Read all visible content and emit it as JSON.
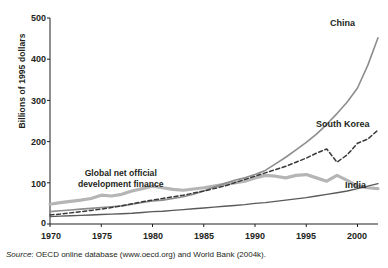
{
  "chart_data": {
    "type": "line",
    "title": "",
    "xlabel": "",
    "ylabel": "Billions of 1995 dollars",
    "xlim": [
      1970,
      2002
    ],
    "ylim": [
      0,
      500
    ],
    "yticks": [
      0,
      100,
      200,
      300,
      400,
      500
    ],
    "xticks": [
      1970,
      1975,
      1980,
      1985,
      1990,
      1995,
      2000
    ],
    "grid": false,
    "legend_position": "inline-labels",
    "x": [
      1970,
      1971,
      1972,
      1973,
      1974,
      1975,
      1976,
      1977,
      1978,
      1979,
      1980,
      1981,
      1982,
      1983,
      1984,
      1985,
      1986,
      1987,
      1988,
      1989,
      1990,
      1991,
      1992,
      1993,
      1994,
      1995,
      1996,
      1997,
      1998,
      1999,
      2000,
      2001,
      2002
    ],
    "series": [
      {
        "name": "Global net official development finance",
        "style": "solid",
        "color": "#b5b5b5",
        "width": 3.2,
        "values": [
          48,
          52,
          55,
          58,
          62,
          70,
          68,
          72,
          80,
          86,
          92,
          88,
          84,
          82,
          85,
          88,
          92,
          96,
          100,
          104,
          112,
          118,
          116,
          112,
          118,
          120,
          112,
          104,
          118,
          106,
          92,
          88,
          86
        ]
      },
      {
        "name": "China",
        "style": "solid",
        "color": "#8d8d8d",
        "width": 1.6,
        "values": [
          30,
          32,
          34,
          36,
          38,
          40,
          42,
          44,
          48,
          52,
          56,
          58,
          62,
          66,
          72,
          80,
          90,
          98,
          106,
          112,
          120,
          130,
          146,
          162,
          180,
          198,
          218,
          242,
          268,
          296,
          330,
          385,
          452
        ]
      },
      {
        "name": "South Korea",
        "style": "dashed",
        "color": "#3a3a3a",
        "width": 1.5,
        "values": [
          22,
          24,
          27,
          30,
          33,
          36,
          40,
          44,
          49,
          54,
          58,
          62,
          66,
          70,
          75,
          80,
          86,
          92,
          100,
          108,
          116,
          124,
          132,
          140,
          150,
          160,
          172,
          182,
          150,
          168,
          196,
          206,
          228
        ]
      },
      {
        "name": "India",
        "style": "solid",
        "color": "#5a5a5a",
        "width": 1.4,
        "values": [
          18,
          19,
          20,
          21,
          22,
          23,
          24,
          25,
          26,
          28,
          30,
          31,
          33,
          35,
          37,
          39,
          41,
          43,
          45,
          47,
          50,
          52,
          55,
          58,
          61,
          64,
          68,
          72,
          76,
          80,
          86,
          92,
          98
        ]
      }
    ],
    "annotations": [
      {
        "text_line1": "Global net official",
        "text_line2": "development finance",
        "series": "Global net official development finance"
      }
    ],
    "series_labels": [
      {
        "label": "China"
      },
      {
        "label": "South Korea"
      },
      {
        "label": "India"
      }
    ],
    "source": {
      "prefix": "Source",
      "text": ": OECD online database (www.oecd.org) and World Bank (2004k)."
    }
  }
}
